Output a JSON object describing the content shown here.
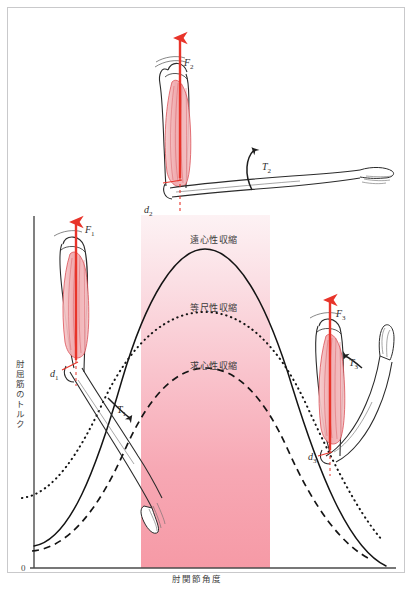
{
  "figure": {
    "title_visible": false,
    "background": "#ffffff",
    "frame_color": "#c9c9cb"
  },
  "axes": {
    "y_label": "肘屈筋のトルク",
    "x_label": "肘関節角度",
    "origin_label": "0",
    "axis_color": "#4a4a4a"
  },
  "band": {
    "name": "highlight-band",
    "color_top": "#fdf0f3",
    "color_bottom": "#f79aa7",
    "x_start_px": 141,
    "x_end_px": 270
  },
  "curves": [
    {
      "id": "eccentric",
      "label": "遠心性収縮",
      "style": "solid",
      "color": "#1a1a1a",
      "peak_value": 1.0,
      "label_x": 190,
      "label_y": 238
    },
    {
      "id": "isometric",
      "label": "等尺性収縮",
      "style": "dotted",
      "color": "#1a1a1a",
      "peak_value": 0.72,
      "label_x": 190,
      "label_y": 305
    },
    {
      "id": "concentric",
      "label": "求心性収縮",
      "style": "dashed",
      "color": "#1a1a1a",
      "peak_value": 0.5,
      "label_x": 190,
      "label_y": 363
    }
  ],
  "annotations": {
    "forces": [
      {
        "id": "F1",
        "text": "F",
        "sub": "1",
        "x": 85,
        "y": 228,
        "color": "#e8342a"
      },
      {
        "id": "F2",
        "text": "F",
        "sub": "2",
        "x": 184,
        "y": 60,
        "color": "#e8342a"
      },
      {
        "id": "F3",
        "text": "F",
        "sub": "3",
        "x": 336,
        "y": 311,
        "color": "#e8342a"
      }
    ],
    "torques": [
      {
        "id": "T1",
        "text": "T",
        "sub": "1",
        "x": 117,
        "y": 409
      },
      {
        "id": "T2",
        "text": "T",
        "sub": "2",
        "x": 262,
        "y": 165
      },
      {
        "id": "T3",
        "text": "T",
        "sub": "3",
        "x": 351,
        "y": 361
      }
    ],
    "moment_arms": [
      {
        "id": "d1",
        "text": "d",
        "sub": "1",
        "x": 50,
        "y": 372
      },
      {
        "id": "d2",
        "text": "d",
        "sub": "2",
        "x": 146,
        "y": 208
      },
      {
        "id": "d3",
        "text": "d",
        "sub": "3",
        "x": 309,
        "y": 455
      }
    ]
  },
  "limbs": [
    {
      "id": "limb-left",
      "name": "arm-flexed-left",
      "description": "左：屈曲位の上肢と上腕二頭筋"
    },
    {
      "id": "limb-top",
      "name": "arm-mid-top",
      "description": "上：中間位の上肢と上腕二頭筋"
    },
    {
      "id": "limb-right",
      "name": "arm-extended-right",
      "description": "右：伸展位の上肢と上腕二頭筋"
    }
  ],
  "colors": {
    "muscle_fill": "#f2b9bc",
    "muscle_line": "#d9434a",
    "arrow_red": "#e8342a",
    "bone_line": "#2b2b2b"
  }
}
